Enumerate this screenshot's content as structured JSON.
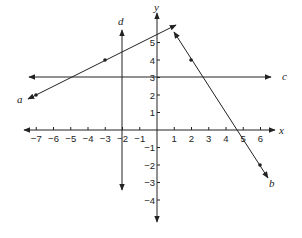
{
  "chart_data": {
    "type": "line",
    "title": "",
    "xlabel": "x",
    "ylabel": "y",
    "xlim": [
      -7.5,
      6.8
    ],
    "ylim": [
      -4.6,
      6.2
    ],
    "grid": false,
    "x_ticks": [
      -7,
      -6,
      -5,
      -4,
      -3,
      -2,
      -1,
      1,
      2,
      3,
      4,
      5,
      6
    ],
    "y_ticks": [
      -4,
      -3,
      -2,
      -1,
      1,
      2,
      3,
      4,
      5
    ],
    "series": [
      {
        "name": "a",
        "kind": "line",
        "equation": "y = 0.5x + 5.5",
        "points": [
          [
            -7,
            2
          ],
          [
            -3,
            4
          ]
        ],
        "arrow_ends": [
          [
            -7.4,
            1.8
          ],
          [
            1.0,
            6.0
          ]
        ]
      },
      {
        "name": "b",
        "kind": "line",
        "equation": "y = -1.5x + 7",
        "points": [
          [
            2,
            4
          ],
          [
            6,
            -2
          ]
        ],
        "arrow_ends": [
          [
            1.0,
            5.5
          ],
          [
            6.6,
            -2.9
          ]
        ]
      },
      {
        "name": "c",
        "kind": "line",
        "equation": "y = 3",
        "points": [],
        "arrow_ends": [
          [
            -7.3,
            3
          ],
          [
            6.7,
            3
          ]
        ]
      },
      {
        "name": "d",
        "kind": "line",
        "equation": "x = -2",
        "points": [],
        "arrow_ends": [
          [
            -2,
            4.7
          ],
          [
            -2,
            -3.5
          ]
        ]
      }
    ]
  },
  "axes": {
    "x_label": "x",
    "y_label": "y",
    "x_tick_labels": [
      "−7",
      "−6",
      "−5",
      "−4",
      "−3",
      "−2",
      "−1",
      "1",
      "2",
      "3",
      "4",
      "5",
      "6"
    ],
    "y_tick_labels": [
      "5",
      "4",
      "3",
      "2",
      "1",
      "−1",
      "−2",
      "−3",
      "−4"
    ]
  },
  "labels": {
    "a": "a",
    "b": "b",
    "c": "c",
    "d": "d"
  }
}
